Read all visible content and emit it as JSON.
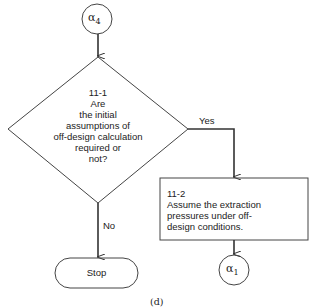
{
  "diagram": {
    "start_connector": {
      "label": "α",
      "sub": "4"
    },
    "decision": {
      "id": "11-1",
      "lines": [
        "Are",
        "the initial",
        "assumptions of",
        "off-design calculation",
        "required or",
        "not?"
      ]
    },
    "yes_label": "Yes",
    "no_label": "No",
    "process": {
      "id": "11-2",
      "lines": [
        "Assume the extraction",
        "pressures under off-",
        "design conditions."
      ]
    },
    "stop_label": "Stop",
    "end_connector": {
      "label": "α",
      "sub": "1"
    },
    "caption": "(d)"
  }
}
